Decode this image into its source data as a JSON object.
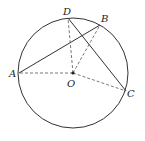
{
  "diagram": {
    "type": "circle-geometry",
    "circle": {
      "center_label": "O",
      "cx": 73,
      "cy": 73,
      "r": 55
    },
    "points": [
      {
        "label": "A",
        "x": 19,
        "y": 73,
        "lx": 9,
        "ly": 77
      },
      {
        "label": "B",
        "x": 100,
        "y": 25,
        "lx": 101,
        "ly": 22
      },
      {
        "label": "D",
        "x": 68,
        "y": 18,
        "lx": 63,
        "ly": 15
      },
      {
        "label": "C",
        "x": 126,
        "y": 91,
        "lx": 127,
        "ly": 97
      },
      {
        "label": "O",
        "x": 73,
        "y": 73,
        "lx": 67,
        "ly": 87
      }
    ],
    "solid_segments": [
      "AB",
      "DC"
    ],
    "dashed_segments": [
      "OA",
      "OB",
      "OD",
      "OC"
    ],
    "colors": {
      "stroke": "#333333",
      "background": "#ffffff"
    }
  }
}
